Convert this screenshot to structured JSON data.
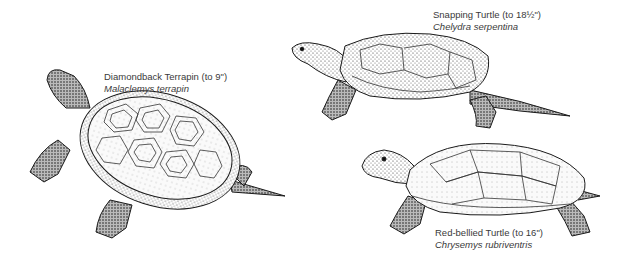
{
  "figure": {
    "background": "#ffffff",
    "ink_color": "#1a1a1a",
    "text_color": "#3a3a3a"
  },
  "turtles": [
    {
      "id": "diamondback-terrapin",
      "common_name": "Diamondback Terrapin (to 9\")",
      "scientific_name": "Malaclemys terrapin"
    },
    {
      "id": "snapping-turtle",
      "common_name": "Snapping Turtle (to 18½\")",
      "scientific_name": "Chelydra serpentina"
    },
    {
      "id": "red-bellied-turtle",
      "common_name": "Red-bellied Turtle (to 16\")",
      "scientific_name": "Chrysemys rubriventris"
    }
  ]
}
